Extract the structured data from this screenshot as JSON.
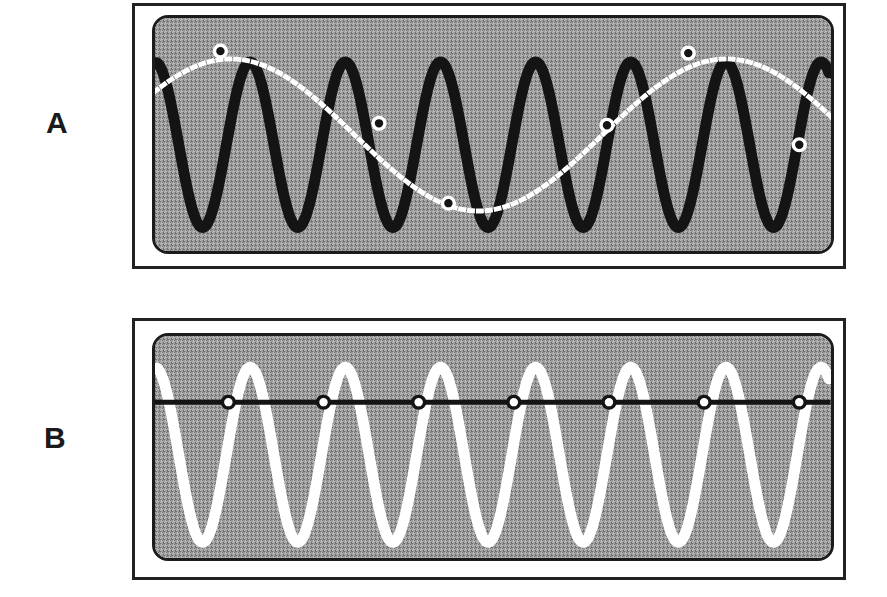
{
  "figure": {
    "background_color": "#ffffff",
    "frame_color": "#222222",
    "screen_fill": "#9d9d9d",
    "panel_count": 2
  },
  "panels": [
    {
      "id": "A",
      "label": "A",
      "description": "High-frequency black carrier waveform with white dotted aliased reconstruction and sample markers",
      "frame": {
        "x": 132,
        "y": 3,
        "width": 714,
        "height": 266
      },
      "screen": {
        "x": 149,
        "y": 12,
        "width": 682,
        "height": 239,
        "corner_radius": 16
      },
      "signal_color": "#141414",
      "alias_color": "#ffffff",
      "marker_face": "#141414",
      "marker_edge": "#ffffff"
    },
    {
      "id": "B",
      "label": "B",
      "description": "High-frequency white waveform with black dotted zero-frequency alias line and sample markers",
      "frame": {
        "x": 132,
        "y": 318,
        "width": 714,
        "height": 262
      },
      "screen": {
        "x": 149,
        "y": 330,
        "width": 682,
        "height": 228,
        "corner_radius": 16
      },
      "signal_color": "#ffffff",
      "alias_color": "#141414",
      "marker_face": "#ffffff",
      "marker_edge": "#141414"
    }
  ],
  "chart_data": [
    {
      "type": "line",
      "panel": "A",
      "title": "",
      "xlabel": "",
      "ylabel": "",
      "xlim": [
        0,
        682
      ],
      "ylim": [
        0,
        239
      ],
      "grid": false,
      "legend": false,
      "series": [
        {
          "name": "carrier-waveform",
          "role": "true-signal",
          "color": "#141414",
          "stroke_width": 11,
          "style": "solid",
          "cycles": 7.2,
          "period_px": 96,
          "amplitude_px": 85,
          "baseline_y": 130,
          "phase_deg": 90,
          "peaks_x": [
            58,
            154,
            250,
            346,
            442,
            538,
            634
          ],
          "peaks_y": 45,
          "troughs_x": [
            106,
            202,
            298,
            394,
            490,
            586,
            672
          ],
          "troughs_y": 215
        },
        {
          "name": "aliased-reconstruction",
          "role": "alias-signal",
          "color": "#ffffff",
          "stroke_width": 5,
          "style": "dotted",
          "dash_pattern": "3 6",
          "cycles": 1.35,
          "period_px": 500,
          "amplitude_px": 78,
          "baseline_y": 120,
          "phase_deg": 35
        }
      ],
      "samples": {
        "name": "sample-points",
        "count": 6,
        "marker": "circle",
        "radius_px": 6,
        "face_color": "#141414",
        "edge_color": "#ffffff",
        "points": [
          {
            "index": 1,
            "x": 66,
            "y": 34
          },
          {
            "index": 2,
            "x": 226,
            "y": 108
          },
          {
            "index": 3,
            "x": 296,
            "y": 190
          },
          {
            "index": 4,
            "x": 456,
            "y": 110
          },
          {
            "index": 5,
            "x": 538,
            "y": 36
          },
          {
            "index": 6,
            "x": 650,
            "y": 130
          }
        ]
      }
    },
    {
      "type": "line",
      "panel": "B",
      "title": "",
      "xlabel": "",
      "ylabel": "",
      "xlim": [
        0,
        682
      ],
      "ylim": [
        0,
        228
      ],
      "grid": false,
      "legend": false,
      "series": [
        {
          "name": "carrier-waveform",
          "role": "true-signal",
          "color": "#ffffff",
          "stroke_width": 11,
          "style": "solid",
          "cycles": 7.2,
          "period_px": 96,
          "amplitude_px": 90,
          "baseline_y": 122,
          "phase_deg": 90,
          "peaks_x": [
            58,
            154,
            250,
            346,
            442,
            538,
            634
          ],
          "peaks_y": 35,
          "troughs_x": [
            106,
            202,
            298,
            394,
            490,
            586,
            672
          ],
          "troughs_y": 212
        },
        {
          "name": "aliased-reconstruction",
          "role": "alias-signal",
          "color": "#141414",
          "stroke_width": 5,
          "style": "dotted",
          "dash_pattern": "4 5",
          "constant_value_y": 68,
          "frequency": 0,
          "note": "DC line - alias frequency is zero"
        }
      ],
      "samples": {
        "name": "sample-points",
        "count": 7,
        "marker": "circle",
        "radius_px": 6,
        "face_color": "#ffffff",
        "edge_color": "#141414",
        "points": [
          {
            "index": 1,
            "x": 74,
            "y": 68
          },
          {
            "index": 2,
            "x": 170,
            "y": 68
          },
          {
            "index": 3,
            "x": 266,
            "y": 68
          },
          {
            "index": 4,
            "x": 362,
            "y": 68
          },
          {
            "index": 5,
            "x": 458,
            "y": 68
          },
          {
            "index": 6,
            "x": 554,
            "y": 68
          },
          {
            "index": 7,
            "x": 650,
            "y": 68
          }
        ]
      }
    }
  ]
}
